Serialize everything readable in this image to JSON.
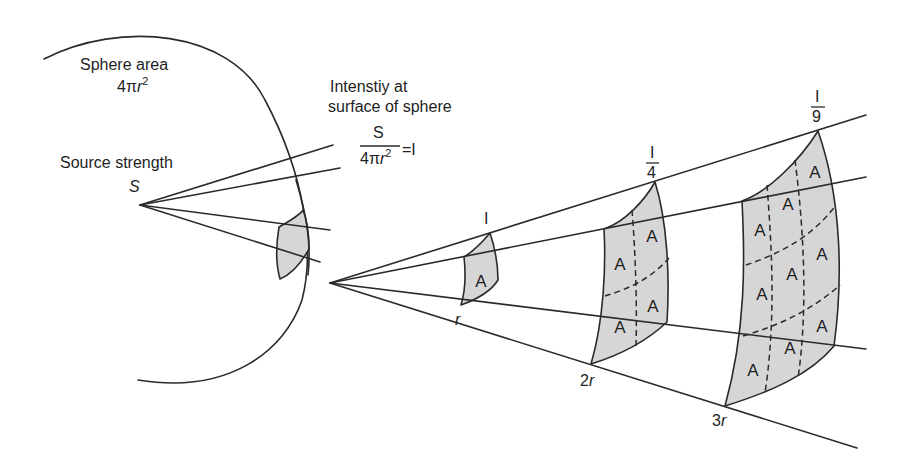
{
  "labels": {
    "sphere_area": "Sphere area",
    "sphere_area_formula": "4πr²",
    "sphere_area_base": "4π",
    "sphere_area_var": "r",
    "sphere_area_exp": "2",
    "source_strength": "Source strength",
    "source_symbol": "S",
    "intensity_line1": "Intenstiy at",
    "intensity_line2": "surface of sphere",
    "intensity_numerator": "S",
    "intensity_denominator_base": "4π",
    "intensity_denominator_var": "r",
    "intensity_denominator_exp": "2",
    "intensity_equals": "=I"
  },
  "distances": [
    {
      "label_num": "",
      "label_var": "r",
      "intensity_num": "I",
      "intensity_den": ""
    },
    {
      "label_num": "2",
      "label_var": "r",
      "intensity_num": "I",
      "intensity_den": "4"
    },
    {
      "label_num": "3",
      "label_var": "r",
      "intensity_num": "I",
      "intensity_den": "9"
    }
  ],
  "area_label": "A",
  "colors": {
    "line": "#2a2a2a",
    "patch_fill": "#d6d6d6",
    "background": "#ffffff"
  }
}
